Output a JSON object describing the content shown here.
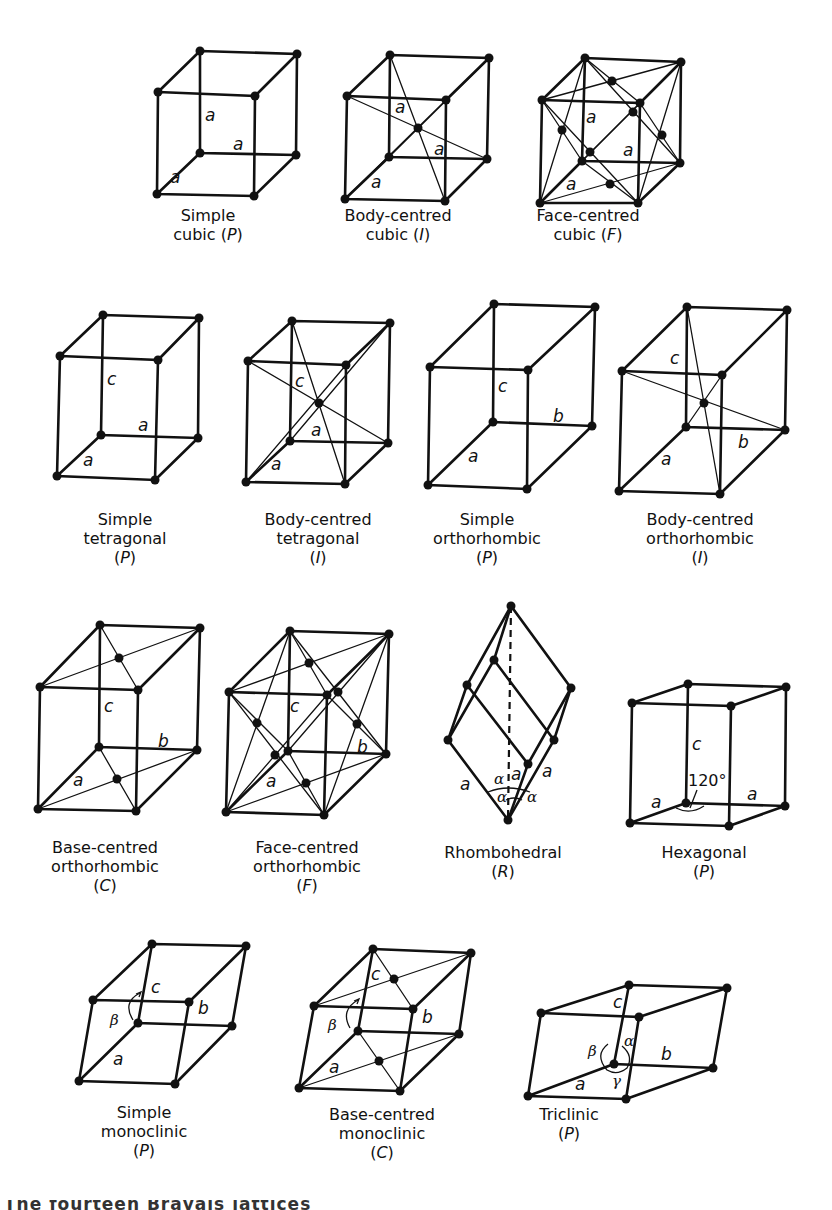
{
  "figure": {
    "title": "The fourteen Bravais lattices",
    "footer_partial": "The fourteen Bravais lattices"
  },
  "lattices": [
    {
      "id": "simple-cubic",
      "line1": "Simple",
      "line2": "cubic (",
      "symbol": "P",
      "line2_end": ")",
      "axis_labels": [
        "a",
        "a",
        "a"
      ]
    },
    {
      "id": "body-centred-cubic",
      "line1": "Body-centred",
      "line2": "cubic (",
      "symbol": "I",
      "line2_end": ")",
      "axis_labels": [
        "a",
        "a",
        "a"
      ]
    },
    {
      "id": "face-centred-cubic",
      "line1": "Face-centred",
      "line2": "cubic (",
      "symbol": "F",
      "line2_end": ")",
      "axis_labels": [
        "a",
        "a",
        "a"
      ]
    },
    {
      "id": "simple-tetragonal",
      "line1": "Simple",
      "line2": "tetragonal",
      "symbol": "P",
      "axis_labels": [
        "c",
        "a",
        "a"
      ]
    },
    {
      "id": "body-centred-tetragonal",
      "line1": "Body-centred",
      "line2": "tetragonal",
      "symbol": "I",
      "axis_labels": [
        "c",
        "a",
        "a"
      ]
    },
    {
      "id": "simple-orthorhombic",
      "line1": "Simple",
      "line2": "orthorhombic",
      "symbol": "P",
      "axis_labels": [
        "c",
        "b",
        "a"
      ]
    },
    {
      "id": "body-centred-orthorhombic",
      "line1": "Body-centred",
      "line2": "orthorhombic",
      "symbol": "I",
      "axis_labels": [
        "c",
        "b",
        "a"
      ]
    },
    {
      "id": "base-centred-orthorhombic",
      "line1": "Base-centred",
      "line2": "orthorhombic",
      "symbol": "C",
      "axis_labels": [
        "c",
        "b",
        "a"
      ]
    },
    {
      "id": "face-centred-orthorhombic",
      "line1": "Face-centred",
      "line2": "orthorhombic",
      "symbol": "F",
      "axis_labels": [
        "c",
        "b",
        "a"
      ]
    },
    {
      "id": "rhombohedral",
      "line1": "Rhombohedral",
      "line2": "",
      "symbol": "R",
      "axis_labels": [
        "a",
        "a",
        "a"
      ],
      "angle_labels": [
        "α",
        "α",
        "α"
      ]
    },
    {
      "id": "hexagonal",
      "line1": "Hexagonal",
      "line2": "",
      "symbol": "P",
      "axis_labels": [
        "c",
        "a",
        "a"
      ],
      "angle_label": "120°"
    },
    {
      "id": "simple-monoclinic",
      "line1": "Simple",
      "line2": "monoclinic",
      "symbol": "P",
      "axis_labels": [
        "c",
        "b",
        "a"
      ],
      "angle_labels": [
        "β"
      ]
    },
    {
      "id": "base-centred-monoclinic",
      "line1": "Base-centred",
      "line2": "monoclinic",
      "symbol": "C",
      "axis_labels": [
        "c",
        "b",
        "a"
      ],
      "angle_labels": [
        "β"
      ]
    },
    {
      "id": "triclinic",
      "line1": "Triclinic",
      "line2": "",
      "symbol": "P",
      "axis_labels": [
        "c",
        "b",
        "a"
      ],
      "angle_labels": [
        "β",
        "α",
        "γ"
      ]
    }
  ]
}
